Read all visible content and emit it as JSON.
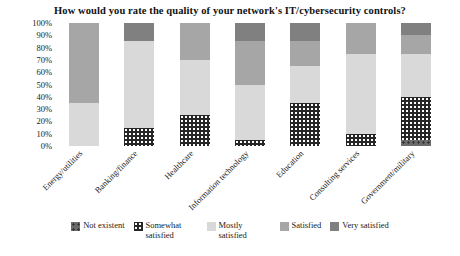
{
  "chart_data": {
    "type": "bar",
    "subtype": "stacked-percentage-column",
    "title": "How would you rate the quality of your network's IT/cybersecurity controls?",
    "xlabel": "",
    "ylabel": "",
    "ylim": [
      0,
      100
    ],
    "ytick_labels": [
      "100%",
      "90%",
      "80%",
      "70%",
      "60%",
      "50%",
      "40%",
      "30%",
      "20%",
      "10%",
      "0%"
    ],
    "ytick_values": [
      100,
      90,
      80,
      70,
      60,
      50,
      40,
      30,
      20,
      10,
      0
    ],
    "grid": false,
    "legend_position": "bottom",
    "categories": [
      "Energy/utilities",
      "Banking/finance",
      "Healthcare",
      "Information technology",
      "Education",
      "Consulting services",
      "Government/military"
    ],
    "series": [
      {
        "name": "Not existent",
        "color": "#6b6b6b",
        "pattern": "speckled",
        "values": [
          0,
          0,
          0,
          0,
          0,
          0,
          5
        ]
      },
      {
        "name": "Somewhat satisfied",
        "color": "#262626",
        "pattern": "dotted",
        "values": [
          0,
          15,
          25,
          5,
          35,
          10,
          35
        ]
      },
      {
        "name": "Mostly satisfied",
        "color": "#d9d9d9",
        "pattern": "solid",
        "values": [
          35,
          70,
          45,
          45,
          30,
          65,
          35
        ]
      },
      {
        "name": "Satisfied",
        "color": "#a6a6a6",
        "pattern": "solid",
        "values": [
          65,
          0,
          30,
          35,
          20,
          25,
          15
        ]
      },
      {
        "name": "Very satisfied",
        "color": "#808080",
        "pattern": "solid",
        "values": [
          0,
          15,
          0,
          15,
          15,
          0,
          10
        ]
      }
    ]
  }
}
